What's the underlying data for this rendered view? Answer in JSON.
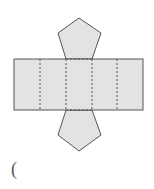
{
  "figure": {
    "type": "net of a pentagonal prism",
    "colors": {
      "fill": "#e3e3e3",
      "stroke": "#555555",
      "fold_line": "#555555",
      "background": "#ffffff"
    },
    "rectangle": {
      "x": 14,
      "y": 59,
      "width": 129,
      "height": 51
    },
    "fold_lines_x": [
      40,
      66,
      92,
      117
    ],
    "top_pentagon": [
      [
        79,
        18
      ],
      [
        101,
        33
      ],
      [
        92,
        59
      ],
      [
        66,
        59
      ],
      [
        58,
        33
      ]
    ],
    "bottom_pentagon": [
      [
        66,
        110
      ],
      [
        92,
        110
      ],
      [
        101,
        135
      ],
      [
        79,
        151
      ],
      [
        58,
        135
      ]
    ]
  },
  "answer_blank": {
    "open_paren": "("
  }
}
